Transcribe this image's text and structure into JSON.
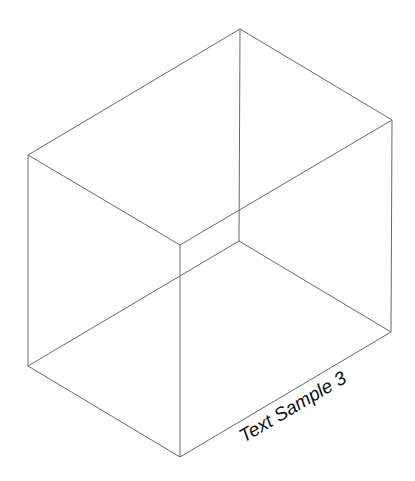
{
  "diagram": {
    "type": "isometric-wireframe-box",
    "label": "Text Sample 3",
    "colors": {
      "background": "#ffffff",
      "edge": "#6a6a6a",
      "text": "#111111"
    },
    "vertices": {
      "top_back": [
        240,
        29
      ],
      "top_left": [
        28,
        155
      ],
      "top_right": [
        392,
        120
      ],
      "top_front": [
        180,
        245
      ],
      "bottom_back": [
        239,
        241
      ],
      "bottom_left": [
        28,
        366
      ],
      "bottom_right": [
        391,
        332
      ],
      "bottom_front": [
        180,
        457
      ]
    }
  }
}
